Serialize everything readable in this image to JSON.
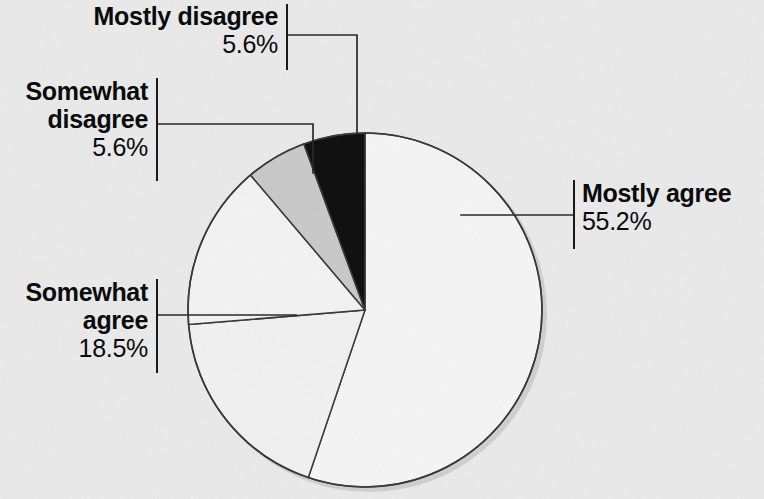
{
  "chart_data": {
    "type": "pie",
    "title": "",
    "subtitle": "",
    "xlabel": "",
    "ylabel": "",
    "legend_position": "callout-labels",
    "grid": false,
    "units": "percent",
    "total": 100,
    "categories": [
      "Mostly agree",
      "Somewhat agree",
      "Somewhat disagree",
      "Mostly disagree"
    ],
    "values": [
      55.2,
      18.5,
      5.6,
      5.6
    ],
    "slices": [
      {
        "label": "Mostly agree",
        "value_text": "55.2%",
        "value": 55.2,
        "fill": "#f4f4f4",
        "stroke": "#3a3a3a",
        "start_angle_deg": 0,
        "end_angle_deg": 198.7
      },
      {
        "label": "Somewhat agree",
        "value_text": "18.5%",
        "value": 18.5,
        "fill": "#f0f0f0",
        "stroke": "#3a3a3a",
        "start_angle_deg": 198.7,
        "end_angle_deg": 265.3
      },
      {
        "label": "",
        "value_text": "",
        "value": 15.1,
        "fill": "#f2f2f2",
        "stroke": "#3a3a3a",
        "start_angle_deg": 265.3,
        "end_angle_deg": 319.7
      },
      {
        "label": "Somewhat disagree",
        "value_text": "5.6%",
        "value": 5.6,
        "fill": "#c9c9c9",
        "stroke": "#3a3a3a",
        "start_angle_deg": 319.7,
        "end_angle_deg": 339.8
      },
      {
        "label": "Mostly disagree",
        "value_text": "5.6%",
        "value": 5.6,
        "fill": "#111111",
        "stroke": "#3a3a3a",
        "start_angle_deg": 339.8,
        "end_angle_deg": 360
      }
    ],
    "colors": {
      "background": "#e9e9e9",
      "slice_light": "#f4f4f4",
      "slice_gray": "#c9c9c9",
      "slice_black": "#111111",
      "outline": "#3a3a3a",
      "leader": "#2a2a2a",
      "text": "#0b0b0b"
    }
  },
  "labels": {
    "mostly_disagree": {
      "name": "Mostly disagree",
      "pct": "5.6%"
    },
    "somewhat_disagree_line1": "Somewhat",
    "somewhat_disagree_line2": "disagree",
    "somewhat_disagree_pct": "5.6%",
    "somewhat_agree_line1": "Somewhat",
    "somewhat_agree_line2": "agree",
    "somewhat_agree_pct": "18.5%",
    "mostly_agree": {
      "name": "Mostly agree",
      "pct": "55.2%"
    }
  }
}
